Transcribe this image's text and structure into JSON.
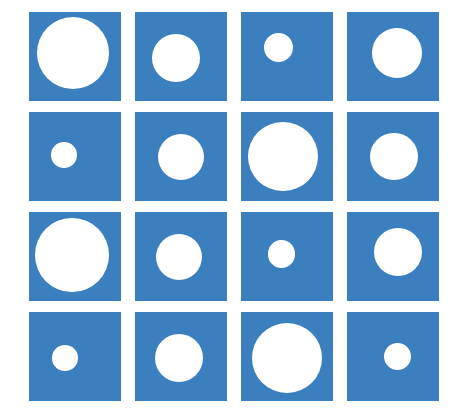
{
  "figure": {
    "title": "Grid of blue squares containing white circles of varying size",
    "background_color": "#ffffff",
    "width": 465,
    "height": 414
  },
  "palette": {
    "square_fill": "#3c7fbe",
    "circle_fill": "#ffffff",
    "page_background": "#ffffff"
  },
  "layout": {
    "rows": 4,
    "columns": 4,
    "origin_x": 29,
    "origin_y": 12,
    "square_width": 92,
    "square_height": 89,
    "column_pitch": 106,
    "row_pitch": 100,
    "gap_x": 14,
    "gap_y": 11
  },
  "chart_data": {
    "type": "heatmap",
    "title": "Grid of blue squares containing white circles of varying size",
    "subtitle": "",
    "xlabel": "",
    "ylabel": "",
    "grid": false,
    "legend": "none",
    "categories": [
      "Column 1",
      "Column 2",
      "Column 3",
      "Column 4"
    ],
    "row_labels": [
      "Row 1",
      "Row 2",
      "Row 3",
      "Row 4"
    ],
    "value_unit": "circle diameter as percent of square width",
    "value_range": [
      26,
      80
    ],
    "series": [
      {
        "name": "Row 1",
        "values": [
          78,
          52,
          32,
          54
        ]
      },
      {
        "name": "Row 2",
        "values": [
          28,
          50,
          76,
          52
        ]
      },
      {
        "name": "Row 3",
        "values": [
          80,
          50,
          30,
          52
        ]
      },
      {
        "name": "Row 4",
        "values": [
          28,
          52,
          76,
          30
        ]
      }
    ],
    "cells": [
      {
        "id": "r1c1",
        "row": 1,
        "col": 1,
        "diameter_pct": 78,
        "center_x_pct": 48,
        "center_y_pct": 46,
        "size_label": "large"
      },
      {
        "id": "r1c2",
        "row": 1,
        "col": 2,
        "diameter_pct": 52,
        "center_x_pct": 45,
        "center_y_pct": 52,
        "size_label": "medium"
      },
      {
        "id": "r1c3",
        "row": 1,
        "col": 3,
        "diameter_pct": 32,
        "center_x_pct": 41,
        "center_y_pct": 40,
        "size_label": "small"
      },
      {
        "id": "r1c4",
        "row": 1,
        "col": 4,
        "diameter_pct": 54,
        "center_x_pct": 54,
        "center_y_pct": 46,
        "size_label": "medium"
      },
      {
        "id": "r2c1",
        "row": 2,
        "col": 1,
        "diameter_pct": 28,
        "center_x_pct": 38,
        "center_y_pct": 48,
        "size_label": "small"
      },
      {
        "id": "r2c2",
        "row": 2,
        "col": 2,
        "diameter_pct": 50,
        "center_x_pct": 50,
        "center_y_pct": 50,
        "size_label": "medium"
      },
      {
        "id": "r2c3",
        "row": 2,
        "col": 3,
        "diameter_pct": 76,
        "center_x_pct": 46,
        "center_y_pct": 50,
        "size_label": "large"
      },
      {
        "id": "r2c4",
        "row": 2,
        "col": 4,
        "diameter_pct": 52,
        "center_x_pct": 51,
        "center_y_pct": 50,
        "size_label": "medium"
      },
      {
        "id": "r3c1",
        "row": 3,
        "col": 1,
        "diameter_pct": 80,
        "center_x_pct": 47,
        "center_y_pct": 48,
        "size_label": "large"
      },
      {
        "id": "r3c2",
        "row": 3,
        "col": 2,
        "diameter_pct": 50,
        "center_x_pct": 48,
        "center_y_pct": 50,
        "size_label": "medium"
      },
      {
        "id": "r3c3",
        "row": 3,
        "col": 3,
        "diameter_pct": 30,
        "center_x_pct": 44,
        "center_y_pct": 47,
        "size_label": "small"
      },
      {
        "id": "r3c4",
        "row": 3,
        "col": 4,
        "diameter_pct": 52,
        "center_x_pct": 55,
        "center_y_pct": 45,
        "size_label": "medium"
      },
      {
        "id": "r4c1",
        "row": 4,
        "col": 1,
        "diameter_pct": 28,
        "center_x_pct": 39,
        "center_y_pct": 52,
        "size_label": "small"
      },
      {
        "id": "r4c2",
        "row": 4,
        "col": 2,
        "diameter_pct": 52,
        "center_x_pct": 48,
        "center_y_pct": 52,
        "size_label": "medium"
      },
      {
        "id": "r4c3",
        "row": 4,
        "col": 3,
        "diameter_pct": 76,
        "center_x_pct": 50,
        "center_y_pct": 52,
        "size_label": "large"
      },
      {
        "id": "r4c4",
        "row": 4,
        "col": 4,
        "diameter_pct": 30,
        "center_x_pct": 55,
        "center_y_pct": 50,
        "size_label": "small"
      }
    ]
  }
}
